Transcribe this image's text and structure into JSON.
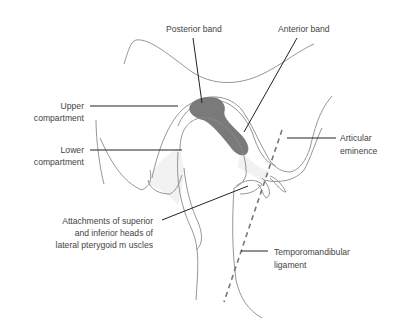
{
  "figure": {
    "colors": {
      "background": "#ffffff",
      "outline": "#8a8a8a",
      "disc_fill": "#7a7a7a",
      "soft_tissue_fill": "#f2f2f2",
      "label_text": "#444444",
      "leader": "#222222"
    },
    "labels": {
      "posterior_band": "Posterior band",
      "anterior_band": "Anterior band",
      "upper_compartment_1": "Upper",
      "upper_compartment_2": "compartment",
      "lower_compartment_1": "Lower",
      "lower_compartment_2": "compartment",
      "articular_eminence_1": "Articular",
      "articular_eminence_2": "eminence",
      "attachments_1": "Attachments of superior",
      "attachments_2": "and inferior heads of",
      "attachments_3": "lateral pterygoid m uscles",
      "tm_ligament_1": "Temporomandibular",
      "tm_ligament_2": "ligament"
    }
  }
}
